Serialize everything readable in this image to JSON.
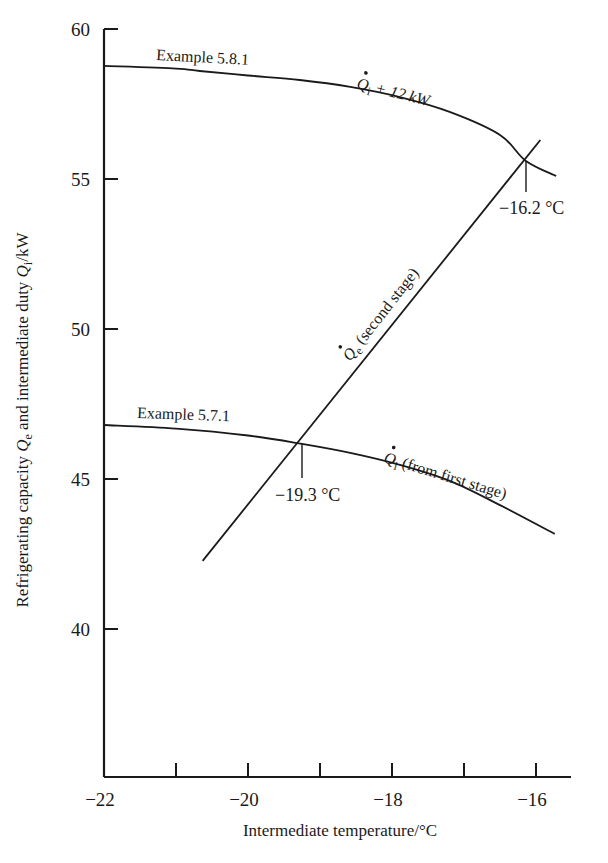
{
  "chart_data": {
    "type": "line",
    "title": "",
    "xlabel": "Intermediate temperature/°C",
    "ylabel": "Refrigerating capacity Q̇e and intermediate duty Q̇i/kW",
    "ylabel_parts": {
      "prefix": "Refrigerating capacity ",
      "sym1": "Q",
      "sub1": "e",
      "mid": " and intermediate duty ",
      "sym2": "Q",
      "sub2": "i",
      "suffix": "/kW"
    },
    "xlim": [
      -22,
      -15.5
    ],
    "ylim": [
      35,
      60
    ],
    "x_ticks": [
      -22,
      -21,
      -20,
      -19,
      -18,
      -17,
      -16
    ],
    "x_tick_labels": [
      "−22",
      "",
      "−20",
      "",
      "−18",
      "",
      "−16"
    ],
    "y_ticks": [
      40,
      45,
      50,
      55,
      60
    ],
    "y_tick_labels": [
      "40",
      "45",
      "50",
      "55",
      "60"
    ],
    "grid": false,
    "legend": null,
    "series": [
      {
        "name": "Q̇i + 12 kW",
        "label_sym": "Q",
        "label_sub": "i",
        "label_rest": "+ 12 kW",
        "note": "Example 5.8.1",
        "x": [
          -22.0,
          -21.0,
          -20.67,
          -20.0,
          -19.28,
          -18.58,
          -17.89,
          -17.19,
          -16.5,
          -16.14,
          -15.72
        ],
        "y": [
          58.77,
          58.68,
          58.6,
          58.45,
          58.3,
          58.07,
          57.73,
          57.23,
          56.47,
          55.6,
          55.1
        ]
      },
      {
        "name": "Q̇i (from first stage)",
        "label_sym": "Q",
        "label_sub": "i",
        "label_rest": "(from first stage)",
        "note": "Example 5.7.1",
        "x": [
          -22.0,
          -21.0,
          -20.0,
          -19.25,
          -18.58,
          -17.89,
          -17.19,
          -16.5,
          -15.74
        ],
        "y": [
          46.8,
          46.68,
          46.45,
          46.17,
          45.87,
          45.47,
          44.93,
          44.13,
          43.17
        ]
      },
      {
        "name": "Q̇e (second stage)",
        "label_sym": "Q",
        "label_sub": "e",
        "label_rest": "(second stage)",
        "x": [
          -20.63,
          -15.94
        ],
        "y": [
          42.27,
          56.3
        ]
      }
    ],
    "annotations": [
      {
        "text": "−16.2 °C",
        "x": -16.2,
        "y": 55.6,
        "type": "intersection"
      },
      {
        "text": "−19.3 °C",
        "x": -19.3,
        "y": 46.17,
        "type": "intersection"
      },
      {
        "text": "Example 5.8.1",
        "attached_to": "Q̇i + 12 kW"
      },
      {
        "text": "Example 5.7.1",
        "attached_to": "Q̇i (from first stage)"
      }
    ]
  },
  "labels": {
    "example_upper": "Example 5.8.1",
    "example_lower": "Example 5.7.1",
    "upper_curve_sym": "Q",
    "upper_curve_sub": "i",
    "upper_curve_rest": " + 12 kW",
    "lower_curve_sym": "Q",
    "lower_curve_sub": "i",
    "lower_curve_rest": " (from first stage)",
    "line_sym": "Q",
    "line_sub": "e",
    "line_rest": " (second stage)",
    "annot_upper": "−16.2 °C",
    "annot_lower": "−19.3 °C"
  },
  "style": {
    "ink": "#1a1a1a",
    "background": "#ffffff"
  }
}
